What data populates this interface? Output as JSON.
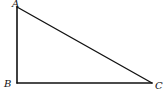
{
  "diagram": {
    "type": "right-triangle",
    "stroke_color": "#111111",
    "background": "#ffffff",
    "vertices": [
      {
        "label": "A",
        "x": 17,
        "y": 7,
        "label_x": 13,
        "label_y": 7
      },
      {
        "label": "B",
        "x": 17,
        "y": 83,
        "label_x": 5,
        "label_y": 87
      },
      {
        "label": "C",
        "x": 152,
        "y": 83,
        "label_x": 155,
        "label_y": 89
      }
    ],
    "right_angle_at": "B",
    "edges": [
      {
        "from": "A",
        "to": "B"
      },
      {
        "from": "B",
        "to": "C"
      },
      {
        "from": "C",
        "to": "A"
      }
    ]
  }
}
